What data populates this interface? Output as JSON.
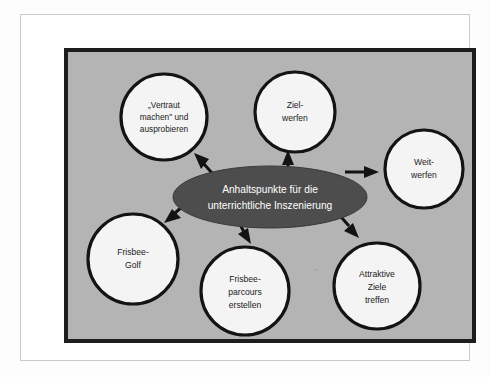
{
  "diagram": {
    "type": "hub-and-spoke-concept-map",
    "language": "de",
    "center": {
      "id": "center-node",
      "line1": "Anhaltspunkte für die",
      "line2": "unterrichtliche Inszenierung",
      "fill_color": "#4d4d4d",
      "text_color": "#ffffff"
    },
    "panel": {
      "background_color": "#b4b4b4",
      "border_color": "#1d1d1d"
    },
    "node_style": {
      "fill_color": "#f4f4f4",
      "border_color": "#131313",
      "text_color": "#1b1b1b"
    },
    "nodes": [
      {
        "id": "node-vertraut-machen",
        "name": "vertraut-machen-ausprobieren",
        "lines": [
          "„Vertraut",
          "machen\" und",
          "ausprobieren"
        ],
        "cx": 96,
        "cy": 65,
        "r": 43,
        "font_size": 8.3
      },
      {
        "id": "node-zielwerfen",
        "name": "zielwerfen",
        "lines": [
          "Ziel-",
          "werfen"
        ],
        "cx": 227,
        "cy": 60,
        "r": 40,
        "font_size": 8.6
      },
      {
        "id": "node-weitwerfen",
        "name": "weitwerfen",
        "lines": [
          "Weit-",
          "werfen"
        ],
        "cx": 356,
        "cy": 117,
        "r": 39,
        "font_size": 8.6
      },
      {
        "id": "node-frisbee-golf",
        "name": "frisbee-golf",
        "lines": [
          "Frisbee-",
          "Golf"
        ],
        "cx": 65,
        "cy": 207,
        "r": 45,
        "font_size": 8.6
      },
      {
        "id": "node-frisbee-parcours",
        "name": "frisbee-parcours-erstellen",
        "lines": [
          "Frisbee-",
          "parcours",
          "erstellen"
        ],
        "cx": 177,
        "cy": 239,
        "r": 44,
        "font_size": 8.6
      },
      {
        "id": "node-attraktive-ziele",
        "name": "attraktive-ziele-treffen",
        "lines": [
          "Attraktive",
          "Ziele",
          "treffen"
        ],
        "cx": 309,
        "cy": 234,
        "r": 43,
        "font_size": 8.6
      }
    ],
    "arrows": [
      {
        "id": "arrow-to-vertraut-machen",
        "from": "center-node",
        "to": "node-vertraut-machen",
        "direction": "up-left"
      },
      {
        "id": "arrow-to-zielwerfen",
        "from": "center-node",
        "to": "node-zielwerfen",
        "direction": "up"
      },
      {
        "id": "arrow-to-weitwerfen",
        "from": "center-node",
        "to": "node-weitwerfen",
        "direction": "right"
      },
      {
        "id": "arrow-to-frisbee-golf",
        "from": "center-node",
        "to": "node-frisbee-golf",
        "direction": "down-left"
      },
      {
        "id": "arrow-to-frisbee-parcours",
        "from": "center-node",
        "to": "node-frisbee-parcours",
        "direction": "down"
      },
      {
        "id": "arrow-to-attraktive-ziele",
        "from": "center-node",
        "to": "node-attraktive-ziele",
        "direction": "down-right"
      }
    ]
  }
}
